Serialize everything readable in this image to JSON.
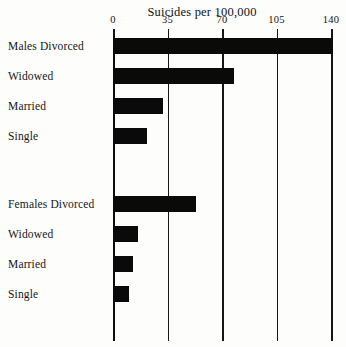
{
  "chart_data": {
    "type": "bar",
    "orientation": "horizontal",
    "title": "Suicides per 100,000",
    "xlabel": "",
    "ylabel": "",
    "xlim": [
      0,
      149
    ],
    "xticks": [
      0,
      35,
      70,
      105,
      140
    ],
    "xtick_labels": [
      "0",
      "35",
      "70",
      "105",
      "140"
    ],
    "grid": true,
    "legend": false,
    "bar_color": "#0a0a0a",
    "groups": [
      {
        "name": "Males",
        "categories": [
          "Males Divorced",
          "Widowed",
          "Married",
          "Single"
        ],
        "values": [
          141,
          78,
          32,
          22
        ]
      },
      {
        "name": "Females",
        "categories": [
          "Females Divorced",
          "Widowed",
          "Married",
          "Single"
        ],
        "values": [
          53,
          16,
          13,
          10
        ]
      }
    ],
    "categories": [
      "Males Divorced",
      "Widowed",
      "Married",
      "Single",
      "Females Divorced",
      "Widowed",
      "Married",
      "Single"
    ],
    "values": [
      141,
      78,
      32,
      22,
      53,
      16,
      13,
      10
    ]
  },
  "bars": [
    {
      "label": "Males Divorced",
      "value": 141,
      "top": 2
    },
    {
      "label": "Widowed",
      "value": 78,
      "top": 32
    },
    {
      "label": "Married",
      "value": 32,
      "top": 62
    },
    {
      "label": "Single",
      "value": 22,
      "top": 92
    },
    {
      "label": "Females Divorced",
      "value": 53,
      "top": 160
    },
    {
      "label": "Widowed",
      "value": 16,
      "top": 190
    },
    {
      "label": "Married",
      "value": 13,
      "top": 220
    },
    {
      "label": "Single",
      "value": 10,
      "top": 250
    }
  ],
  "axis": {
    "ticks": [
      {
        "label": "0",
        "value": 0
      },
      {
        "label": "35",
        "value": 35
      },
      {
        "label": "70",
        "value": 70
      },
      {
        "label": "105",
        "value": 105
      },
      {
        "label": "140",
        "value": 140
      }
    ]
  }
}
